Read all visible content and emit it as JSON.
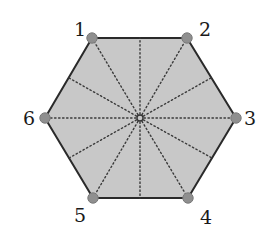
{
  "diagram": {
    "type": "hexagon",
    "colors": {
      "fill": "#c8c8c8",
      "edge": "#2a2a2a",
      "spoke": "#3a3a3a",
      "vertex_dot": "#8f8f8f",
      "vertex_dot_stroke": "#7a7a7a",
      "center_ring": "#333333",
      "label": "#1a1a1a"
    },
    "center": {
      "x": 140,
      "y": 118
    },
    "vertices": [
      {
        "id": "1",
        "label": "1",
        "x": 92,
        "y": 38,
        "label_x": 80,
        "label_y": 36
      },
      {
        "id": "2",
        "label": "2",
        "x": 187,
        "y": 38,
        "label_x": 205,
        "label_y": 36
      },
      {
        "id": "3",
        "label": "3",
        "x": 236,
        "y": 118,
        "label_x": 250,
        "label_y": 125
      },
      {
        "id": "4",
        "label": "4",
        "x": 188,
        "y": 198,
        "label_x": 206,
        "label_y": 224
      },
      {
        "id": "5",
        "label": "5",
        "x": 93,
        "y": 198,
        "label_x": 80,
        "label_y": 222
      },
      {
        "id": "6",
        "label": "6",
        "x": 45,
        "y": 118,
        "label_x": 29,
        "label_y": 125
      }
    ],
    "edge_midpoints": [
      {
        "x": 140,
        "y": 38
      },
      {
        "x": 211,
        "y": 78
      },
      {
        "x": 212,
        "y": 158
      },
      {
        "x": 140,
        "y": 198
      },
      {
        "x": 69,
        "y": 158
      },
      {
        "x": 69,
        "y": 78
      }
    ]
  }
}
